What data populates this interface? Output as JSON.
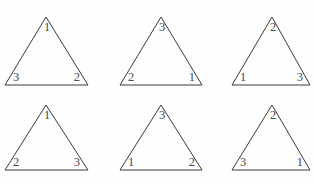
{
  "figure": {
    "background_color": "#fefefe",
    "line_color": "#3a3a3a",
    "label_color": "#4a4a4a",
    "shape": "triangle",
    "rows": 2,
    "columns": 3,
    "triangles": [
      {
        "id": "triangle-1",
        "position": "top-left",
        "apex_label": "1",
        "bottom_left_label": "3",
        "bottom_right_label": "2"
      },
      {
        "id": "triangle-2",
        "position": "top-middle",
        "apex_label": "3",
        "bottom_left_label": "2",
        "bottom_right_label": "1"
      },
      {
        "id": "triangle-3",
        "position": "top-right",
        "apex_label": "2",
        "bottom_left_label": "1",
        "bottom_right_label": "3"
      },
      {
        "id": "triangle-4",
        "position": "bottom-left",
        "apex_label": "1",
        "bottom_left_label": "2",
        "bottom_right_label": "3"
      },
      {
        "id": "triangle-5",
        "position": "bottom-middle",
        "apex_label": "3",
        "bottom_left_label": "1",
        "bottom_right_label": "2"
      },
      {
        "id": "triangle-6",
        "position": "bottom-right",
        "apex_label": "2",
        "bottom_left_label": "3",
        "bottom_right_label": "1"
      }
    ]
  }
}
